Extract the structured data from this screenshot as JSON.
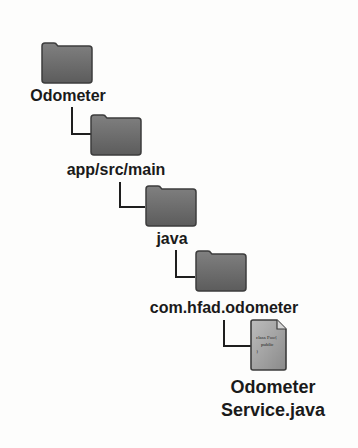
{
  "diagram": {
    "type": "folder-tree",
    "nodes": [
      {
        "id": "root",
        "label": "Odometer",
        "kind": "folder"
      },
      {
        "id": "main",
        "label": "app/src/main",
        "kind": "folder"
      },
      {
        "id": "java",
        "label": "java",
        "kind": "folder"
      },
      {
        "id": "pkg",
        "label": "com.hfad.odometer",
        "kind": "folder"
      },
      {
        "id": "file",
        "label_line1": "Odometer",
        "label_line2": "Service.java",
        "kind": "java-file",
        "file_text": [
          "class Foo{",
          "public",
          "}"
        ]
      }
    ],
    "edges": [
      [
        "root",
        "main"
      ],
      [
        "main",
        "java"
      ],
      [
        "java",
        "pkg"
      ],
      [
        "pkg",
        "file"
      ]
    ],
    "colors": {
      "folder_fill": "#6f6f6f",
      "folder_edge": "#3c3c3c",
      "file_fill": "#a8a8a8",
      "connector": "#1e1e1e",
      "label": "#1a1a1a"
    }
  }
}
